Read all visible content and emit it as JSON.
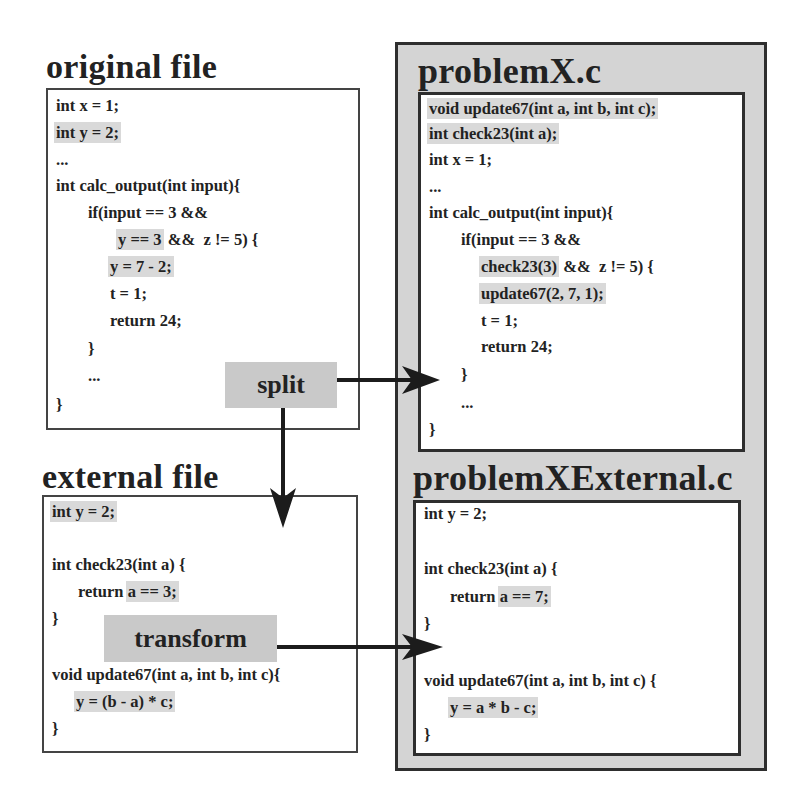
{
  "left": {
    "original_file": {
      "title": "original file",
      "lines": [
        {
          "indent": 0,
          "text": "int x = 1;",
          "highlight": ""
        },
        {
          "indent": 0,
          "text": "int y = 2;",
          "highlight": "int y = 2;"
        },
        {
          "indent": 0,
          "text": "...",
          "highlight": ""
        },
        {
          "indent": 0,
          "text": "int calc_output(int input){",
          "highlight": ""
        },
        {
          "indent": 1,
          "text": "if(input == 3 &&",
          "highlight": ""
        },
        {
          "indent": 2,
          "pre": "",
          "highlight": "y == 3",
          "post": " &&  z != 5) {"
        },
        {
          "indent": 2,
          "text": "y = 7 - 2;",
          "highlight": "y = 7 - 2;"
        },
        {
          "indent": 2,
          "text": "t = 1;",
          "highlight": ""
        },
        {
          "indent": 2,
          "text": "return 24;",
          "highlight": ""
        },
        {
          "indent": 1,
          "text": "}",
          "highlight": ""
        },
        {
          "indent": 1,
          "text": "...",
          "highlight": ""
        },
        {
          "indent": 0,
          "text": "}",
          "highlight": ""
        }
      ]
    },
    "external_file": {
      "title": "external file",
      "lines": [
        {
          "text": "int y = 2;",
          "highlight": "int y = 2;"
        },
        {
          "text": "",
          "highlight": ""
        },
        {
          "text": "int check23(int a) {",
          "highlight": ""
        },
        {
          "pre": "return ",
          "highlight": "a == 3;",
          "post": ""
        },
        {
          "text": "}",
          "highlight": ""
        },
        {
          "text": "",
          "highlight": ""
        },
        {
          "text": "void update67(int a, int b, int c){",
          "highlight": ""
        },
        {
          "pre": "",
          "highlight": "y = (b - a) * c;",
          "post": ""
        },
        {
          "text": "}",
          "highlight": ""
        }
      ]
    }
  },
  "right": {
    "problemX": {
      "title": "problemX.c",
      "lines": [
        {
          "text": "void update67(int a, int b, int c);",
          "highlight": "all"
        },
        {
          "text": "int check23(int a);",
          "highlight": "all"
        },
        {
          "text": "int x = 1;",
          "highlight": ""
        },
        {
          "text": "...",
          "highlight": ""
        },
        {
          "text": "int calc_output(int input){",
          "highlight": ""
        },
        {
          "text": "if(input == 3 &&",
          "highlight": ""
        },
        {
          "pre": "",
          "highlight": "check23(3)",
          "post": " &&  z != 5) {"
        },
        {
          "pre": "",
          "highlight": "update67(2, 7, 1);",
          "post": ""
        },
        {
          "text": "t = 1;",
          "highlight": ""
        },
        {
          "text": "return 24;",
          "highlight": ""
        },
        {
          "text": "}",
          "highlight": ""
        },
        {
          "text": "...",
          "highlight": ""
        },
        {
          "text": "}",
          "highlight": ""
        }
      ]
    },
    "problemXExternal": {
      "title": "problemXExternal.c",
      "lines": [
        {
          "text": "int y = 2;",
          "highlight": ""
        },
        {
          "text": "",
          "highlight": ""
        },
        {
          "text": "int check23(int a) {",
          "highlight": ""
        },
        {
          "pre": "return ",
          "highlight": "a == 7;",
          "post": ""
        },
        {
          "text": "}",
          "highlight": ""
        },
        {
          "text": "",
          "highlight": ""
        },
        {
          "text": "void update67(int a, int b, int c) {",
          "highlight": ""
        },
        {
          "pre": "",
          "highlight": "y = a * b - c;",
          "post": ""
        },
        {
          "text": "}",
          "highlight": ""
        }
      ]
    }
  },
  "operations": {
    "split": "split",
    "transform": "transform"
  },
  "colors": {
    "highlight": "#d9d9d9",
    "outer_panel": "#d4d4d4",
    "label_bg": "#c9c9c9",
    "border": "#2e2e2e"
  }
}
